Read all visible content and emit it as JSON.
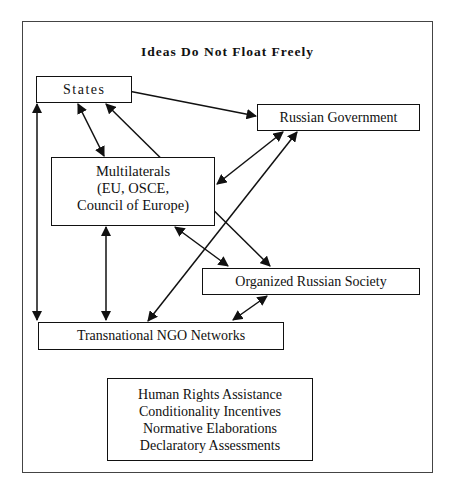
{
  "title": "Ideas Do Not Float Freely",
  "nodes": {
    "states": {
      "label": "States"
    },
    "russian_government": {
      "label": "Russian Government"
    },
    "multilaterals": {
      "lines": [
        "Multilaterals",
        "(EU, OSCE,",
        "Council of Europe)"
      ]
    },
    "organized_russian_society": {
      "label": "Organized Russian Society"
    },
    "transnational_ngo_networks": {
      "label": "Transnational NGO Networks"
    }
  },
  "instruments": {
    "lines": [
      "Human Rights Assistance",
      "Conditionality Incentives",
      "Normative Elaborations",
      "Declaratory Assessments"
    ]
  },
  "edges": [
    {
      "from": "States",
      "to": "Russian Government",
      "direction": "both"
    },
    {
      "from": "States",
      "to": "Multilaterals",
      "direction": "both"
    },
    {
      "from": "States",
      "to": "Organized Russian Society",
      "direction": "both"
    },
    {
      "from": "States",
      "to": "Transnational NGO Networks",
      "direction": "both"
    },
    {
      "from": "Multilaterals",
      "to": "Russian Government",
      "direction": "both"
    },
    {
      "from": "Transnational NGO Networks",
      "to": "Russian Government",
      "direction": "both"
    },
    {
      "from": "Multilaterals",
      "to": "Transnational NGO Networks",
      "direction": "both"
    },
    {
      "from": "Multilaterals",
      "to": "Organized Russian Society",
      "direction": "both"
    },
    {
      "from": "Organized Russian Society",
      "to": "Transnational NGO Networks",
      "direction": "both"
    }
  ]
}
